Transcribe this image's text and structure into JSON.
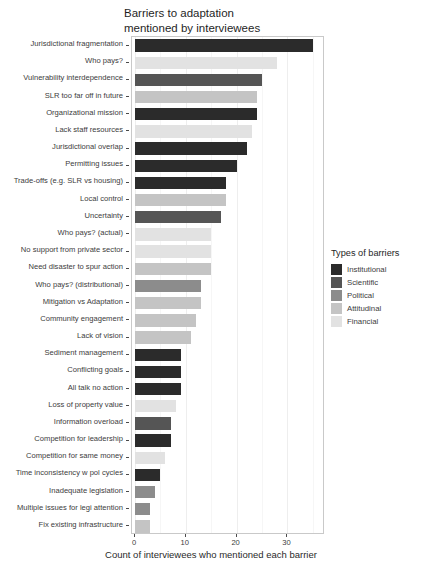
{
  "chart_data": {
    "type": "bar",
    "orientation": "horizontal",
    "title": "Barriers to adaptation\nmentioned by interviewees",
    "xlabel": "Count of interviewees who mentioned each barrier",
    "ylabel": "",
    "xlim": [
      0,
      37
    ],
    "xticks": [
      0,
      10,
      20,
      30
    ],
    "xtick_labels": [
      "0",
      "10",
      "20",
      "30"
    ],
    "grid": true,
    "legend_position": "right",
    "legend_title": "Types of barriers",
    "legend_entries": [
      {
        "label": "Institutional",
        "color": "#2b2b2b"
      },
      {
        "label": "Scientific",
        "color": "#555555"
      },
      {
        "label": "Political",
        "color": "#8c8c8c"
      },
      {
        "label": "Attitudinal",
        "color": "#c4c4c4"
      },
      {
        "label": "Financial",
        "color": "#e2e2e2"
      }
    ],
    "categories": [
      "Jurisdictional fragmentation",
      "Who pays?",
      "Vulnerability interdependence",
      "SLR too far off in future",
      "Organizational mission",
      "Lack staff resources",
      "Jurisdictional overlap",
      "Permitting issues",
      "Trade-offs (e.g. SLR vs housing)",
      "Local control",
      "Uncertainty",
      "Who pays? (actual)",
      "No support from private sector",
      "Need disaster to spur action",
      "Who pays? (distributional)",
      "Mitigation vs Adaptation",
      "Community engagement",
      "Lack of vision",
      "Sediment management",
      "Conflicting goals",
      "All talk no action",
      "Loss of property value",
      "Information overload",
      "Competition for leadership",
      "Competition for same money",
      "Time inconsistency w pol cycles",
      "Inadequate legislation",
      "Multiple issues for legi attention",
      "Fix existing infrastructure"
    ],
    "values": [
      35,
      28,
      25,
      24,
      24,
      23,
      22,
      20,
      18,
      18,
      17,
      15,
      15,
      15,
      13,
      13,
      12,
      11,
      9,
      9,
      9,
      8,
      7,
      7,
      6,
      5,
      4,
      3,
      3
    ],
    "bar_types": [
      "Institutional",
      "Financial",
      "Scientific",
      "Attitudinal",
      "Institutional",
      "Financial",
      "Institutional",
      "Institutional",
      "Institutional",
      "Attitudinal",
      "Scientific",
      "Financial",
      "Financial",
      "Attitudinal",
      "Political",
      "Attitudinal",
      "Attitudinal",
      "Attitudinal",
      "Institutional",
      "Institutional",
      "Institutional",
      "Financial",
      "Scientific",
      "Institutional",
      "Financial",
      "Institutional",
      "Political",
      "Political",
      "Attitudinal"
    ]
  }
}
